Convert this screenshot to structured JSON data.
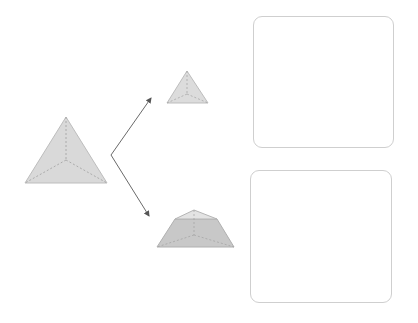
{
  "diagram": {
    "title": "",
    "shapes": [
      {
        "id": "original",
        "label": "",
        "kind": "tetrahedron"
      },
      {
        "id": "top-piece",
        "label": "",
        "kind": "small-tetrahedron"
      },
      {
        "id": "bottom-piece",
        "label": "",
        "kind": "frustum"
      }
    ],
    "answer_boxes": [
      {
        "id": "answer-box-1",
        "content": ""
      },
      {
        "id": "answer-box-2",
        "content": ""
      }
    ],
    "colors": {
      "face_fill": "#d9d9d9",
      "frustum_fill": "#c8c8c8",
      "frustum_top_fill": "#e3e3e3",
      "edge": "#b5b5b5",
      "hidden_edge": "#a8a8a8",
      "arrow": "#666666",
      "box_border": "#cfcfcf"
    }
  }
}
